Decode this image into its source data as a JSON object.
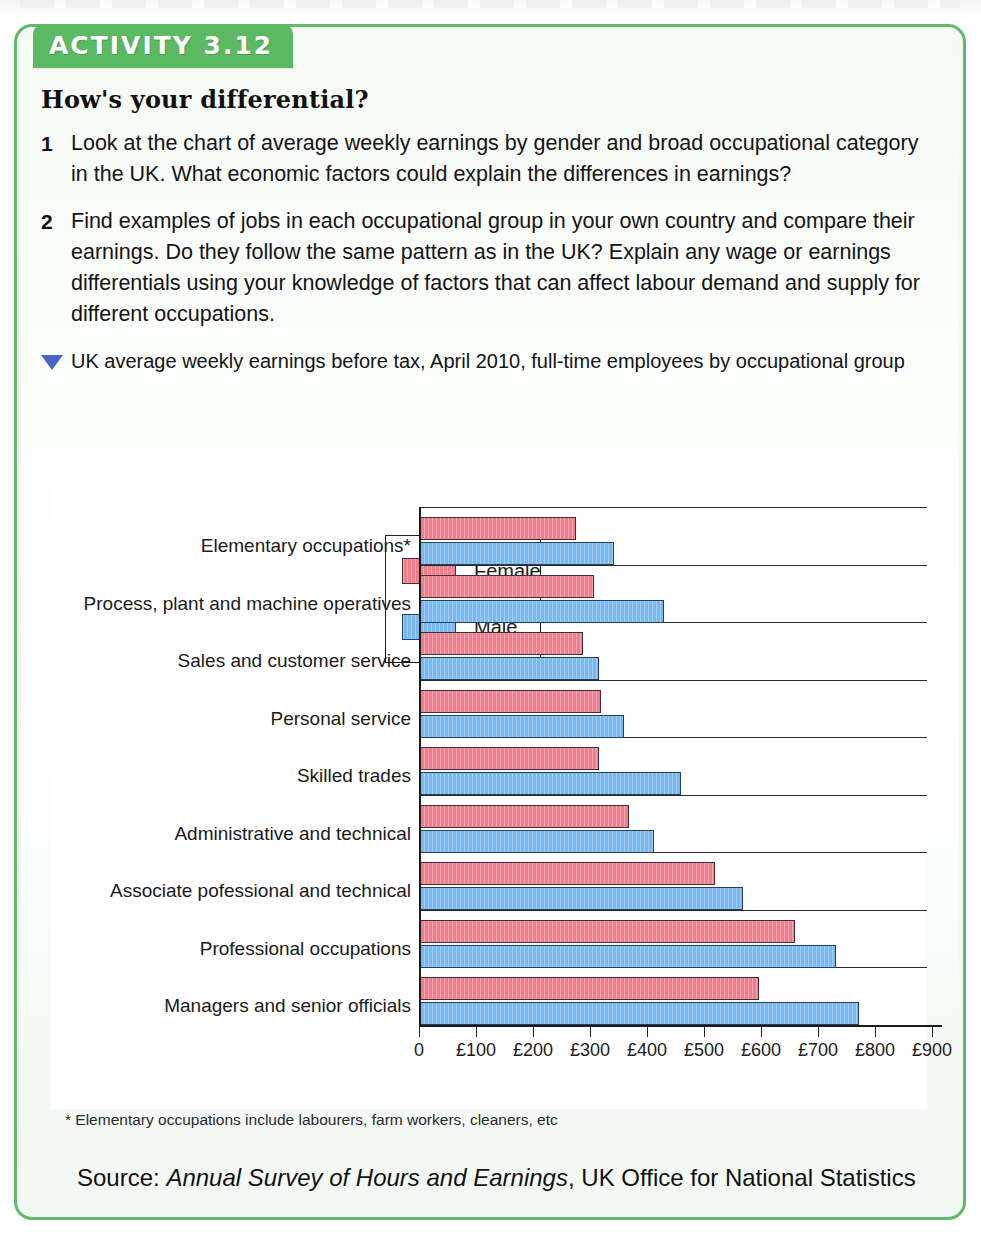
{
  "activity": {
    "tab_label": "ACTIVITY 3.12",
    "title": "How's your differential?",
    "questions": [
      {
        "num": "1",
        "text": "Look at the chart of average weekly earnings by gender and broad occupational category in the UK. What economic factors could explain the differences in earnings?"
      },
      {
        "num": "2",
        "text": "Find examples of jobs in each occupational group in your own country and compare their earnings.  Do they follow the same pattern as in the UK? Explain any wage or earnings differentials using your knowledge of factors that can affect labour demand and supply for different occupations."
      }
    ],
    "figure_caption": "UK average weekly earnings before tax, April 2010, full-time employees by occupational group",
    "footnote": "* Elementary occupations include labourers, farm workers, cleaners, etc",
    "source_prefix": "Source: ",
    "source_title": "Annual Survey of Hours and Earnings",
    "source_suffix": ", UK Office for National Statistics"
  },
  "colors": {
    "frame_green": "#63b96b",
    "tab_green": "#5bb863",
    "female": "#f07f8e",
    "male": "#79b9ef",
    "triangle_blue": "#4a63c9"
  },
  "chart_data": {
    "type": "bar",
    "orientation": "horizontal",
    "title": "UK average weekly earnings before tax, April 2010, full-time employees by occupational group",
    "xlabel": "",
    "ylabel": "",
    "xlim": [
      0,
      900
    ],
    "xticks": [
      0,
      100,
      200,
      300,
      400,
      500,
      600,
      700,
      800,
      900
    ],
    "xtick_labels": [
      "0",
      "£100",
      "£200",
      "£300",
      "£400",
      "£500",
      "£600",
      "£700",
      "£800",
      "£900"
    ],
    "grid": false,
    "legend": [
      "Female",
      "Male"
    ],
    "legend_position": "upper right",
    "categories": [
      "Elementary occupations*",
      "Process, plant and machine operatives",
      "Sales and customer service",
      "Personal service",
      "Skilled trades",
      "Administrative and technical",
      "Associate pofessional and technical",
      "Professional occupations",
      "Managers and senior officials"
    ],
    "series": [
      {
        "name": "Female",
        "values": [
          275,
          307,
          288,
          320,
          316,
          368,
          520,
          660,
          597
        ]
      },
      {
        "name": "Male",
        "values": [
          342,
          430,
          316,
          360,
          460,
          412,
          568,
          732,
          772
        ]
      }
    ]
  }
}
